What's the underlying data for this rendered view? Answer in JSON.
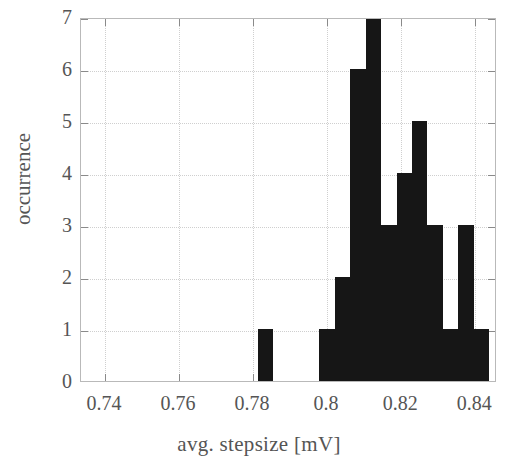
{
  "chart_data": {
    "type": "bar",
    "title": "",
    "subtitle": "",
    "xlabel": "avg. stepsize [mV]",
    "ylabel": "occurrence",
    "xlim": [
      0.7335,
      0.8459
    ],
    "ylim": [
      0,
      7
    ],
    "grid": true,
    "legend": null,
    "legend_position": "none",
    "bar_color": "#161616",
    "bin_width": 0.00417,
    "x_ticks": [
      0.74,
      0.76,
      0.78,
      0.8,
      0.82,
      0.84
    ],
    "x_tick_labels": [
      "0.74",
      "0.76",
      "0.78",
      "0.8",
      "0.82",
      "0.84"
    ],
    "y_ticks": [
      0,
      1,
      2,
      3,
      4,
      5,
      6,
      7
    ],
    "y_tick_labels": [
      "0",
      "1",
      "2",
      "3",
      "4",
      "5",
      "6",
      "7"
    ],
    "bins": [
      {
        "left": 0.78125,
        "right": 0.78542,
        "value": 1
      },
      {
        "left": 0.79792,
        "right": 0.80208,
        "value": 1
      },
      {
        "left": 0.80208,
        "right": 0.80625,
        "value": 2
      },
      {
        "left": 0.80625,
        "right": 0.81042,
        "value": 6
      },
      {
        "left": 0.81042,
        "right": 0.81458,
        "value": 7
      },
      {
        "left": 0.81458,
        "right": 0.81875,
        "value": 3
      },
      {
        "left": 0.81875,
        "right": 0.82292,
        "value": 4
      },
      {
        "left": 0.82292,
        "right": 0.82708,
        "value": 5
      },
      {
        "left": 0.82708,
        "right": 0.83125,
        "value": 3
      },
      {
        "left": 0.83125,
        "right": 0.83542,
        "value": 1
      },
      {
        "left": 0.83542,
        "right": 0.83958,
        "value": 3
      },
      {
        "left": 0.83958,
        "right": 0.84375,
        "value": 1
      }
    ],
    "categories": [
      "0.7833",
      "0.8000",
      "0.8042",
      "0.8083",
      "0.8125",
      "0.8167",
      "0.8208",
      "0.8250",
      "0.8292",
      "0.8333",
      "0.8375",
      "0.8417"
    ],
    "values": [
      1,
      1,
      2,
      6,
      7,
      3,
      4,
      5,
      3,
      1,
      3,
      1
    ]
  }
}
